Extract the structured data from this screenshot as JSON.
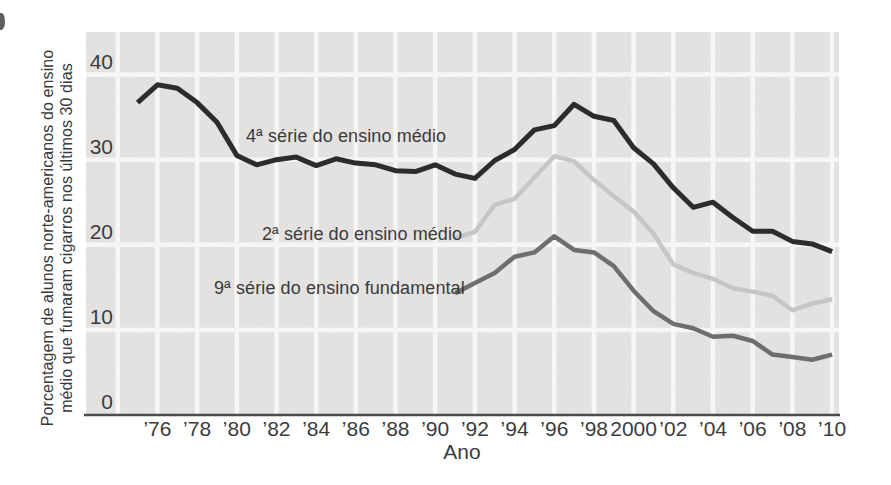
{
  "chart_data": {
    "type": "line",
    "title": "",
    "xlabel": "Ano",
    "ylabel_lines": [
      "Porcentagem de alunos norte-americanos do ensino",
      "médio que fumaram cigarros nos últimos 30 dias"
    ],
    "xlim": [
      1972.4,
      2010.35
    ],
    "ylim": [
      0,
      45
    ],
    "grid": true,
    "legend_position": "inline-labels",
    "yticks": [
      {
        "value": 0,
        "label": "0"
      },
      {
        "value": 10,
        "label": "10"
      },
      {
        "value": 20,
        "label": "20"
      },
      {
        "value": 30,
        "label": "30"
      },
      {
        "value": 40,
        "label": "40"
      }
    ],
    "xticks": [
      {
        "year": 1976,
        "label": "’76"
      },
      {
        "year": 1978,
        "label": "’78"
      },
      {
        "year": 1980,
        "label": "’80"
      },
      {
        "year": 1982,
        "label": "’82"
      },
      {
        "year": 1984,
        "label": "’84"
      },
      {
        "year": 1986,
        "label": "’86"
      },
      {
        "year": 1988,
        "label": "’88"
      },
      {
        "year": 1990,
        "label": "’90"
      },
      {
        "year": 1992,
        "label": "’92"
      },
      {
        "year": 1994,
        "label": "’94"
      },
      {
        "year": 1996,
        "label": "’96"
      },
      {
        "year": 1998,
        "label": "’98"
      },
      {
        "year": 2000,
        "label": "2000"
      },
      {
        "year": 2002,
        "label": "’02"
      },
      {
        "year": 2004,
        "label": "’04"
      },
      {
        "year": 2006,
        "label": "’06"
      },
      {
        "year": 2008,
        "label": "’08"
      },
      {
        "year": 2010,
        "label": "’10"
      }
    ],
    "grid_years": [
      1974,
      1976,
      1978,
      1980,
      1982,
      1984,
      1986,
      1988,
      1990,
      1992,
      1994,
      1996,
      1998,
      2000,
      2002,
      2004,
      2006,
      2008,
      2010
    ],
    "series": [
      {
        "name": "4ª série do ensino médio",
        "color": "#2d2c2c",
        "stroke_width": 5,
        "start_year": 1975,
        "values": [
          36.7,
          38.8,
          38.4,
          36.7,
          34.4,
          30.5,
          29.4,
          30.0,
          30.3,
          29.3,
          30.1,
          29.6,
          29.4,
          28.7,
          28.6,
          29.4,
          28.3,
          27.8,
          29.9,
          31.2,
          33.5,
          34.0,
          36.5,
          35.1,
          34.6,
          31.4,
          29.5,
          26.7,
          24.4,
          25.0,
          23.2,
          21.6,
          21.6,
          20.4,
          20.1,
          19.2
        ]
      },
      {
        "name": "2ª série do ensino médio",
        "color": "#c7c6c4",
        "stroke_width": 4.5,
        "start_year": 1991,
        "values": [
          20.8,
          21.5,
          24.7,
          25.4,
          27.9,
          30.4,
          29.8,
          27.6,
          25.7,
          23.9,
          21.3,
          17.7,
          16.7,
          16.0,
          14.9,
          14.5,
          14.0,
          12.3,
          13.1,
          13.6
        ]
      },
      {
        "name": "9ª série do ensino fundamental",
        "color": "#6f6e6d",
        "stroke_width": 4.5,
        "start_year": 1991,
        "values": [
          14.3,
          15.5,
          16.7,
          18.6,
          19.1,
          21.0,
          19.4,
          19.1,
          17.5,
          14.6,
          12.2,
          10.7,
          10.2,
          9.2,
          9.3,
          8.7,
          7.1,
          6.8,
          6.5,
          7.1
        ]
      }
    ],
    "colors": {
      "plot_bg": "#e4e3e1",
      "gridline": "#fbfaf8",
      "axis": "#4c4c4e",
      "tick_text": "#3c3c3e"
    }
  }
}
